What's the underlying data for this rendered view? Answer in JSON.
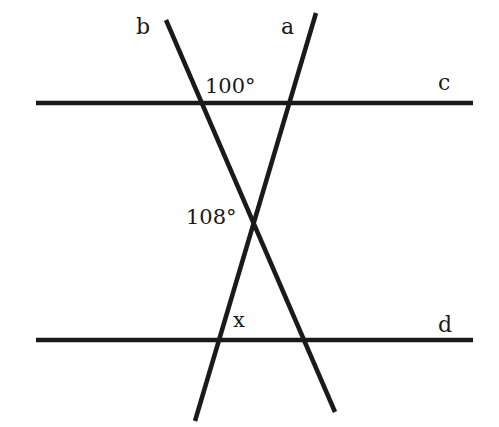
{
  "diagram": {
    "type": "geometry",
    "line_color": "#1a1a1a",
    "background": "#ffffff",
    "lines": [
      {
        "name": "c",
        "label": "c",
        "x1": 36,
        "y1": 103,
        "x2": 473,
        "y2": 103
      },
      {
        "name": "d",
        "label": "d",
        "x1": 36,
        "y1": 340,
        "x2": 473,
        "y2": 340
      },
      {
        "name": "a",
        "label": "a",
        "x1": 316,
        "y1": 13,
        "x2": 195,
        "y2": 421
      },
      {
        "name": "b",
        "label": "b",
        "x1": 166,
        "y1": 20,
        "x2": 335,
        "y2": 412
      }
    ],
    "angles": [
      {
        "id": "angle-100",
        "text": "100°"
      },
      {
        "id": "angle-108",
        "text": "108°"
      },
      {
        "id": "angle-x",
        "text": "x"
      }
    ]
  }
}
